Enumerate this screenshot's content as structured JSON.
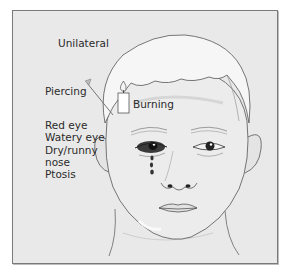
{
  "figure": {
    "type": "medical-illustration",
    "labels": {
      "laterality": "Unilateral",
      "pain_quality_1": "Piercing",
      "pain_quality_2": "Burning"
    },
    "symptoms": [
      "Red eye",
      "Watery eye",
      "Dry/runny",
      "nose",
      "Ptosis"
    ],
    "icons": {
      "pin": "piercing-pin-icon",
      "candle": "burning-candle-icon",
      "tear": "tear-drops-icon"
    },
    "colors": {
      "background": "#e9e9e9",
      "frame_border": "#7a7a7a",
      "face_fill": "#ececec",
      "hair_fill": "#f6f6f6",
      "line": "#555555",
      "eye_shadow": "#2a2a2a",
      "text": "#2b2b2b"
    }
  }
}
